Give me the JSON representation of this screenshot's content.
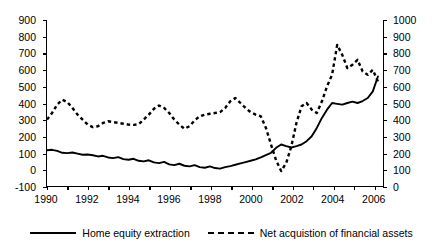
{
  "chart_data": {
    "type": "line",
    "title": "",
    "subtitle": "",
    "xlabel": "",
    "ylabel": "",
    "grid": false,
    "legend_position": "bottom",
    "x_tick_labels": [
      "1990",
      "1992",
      "1994",
      "1996",
      "1998",
      "2000",
      "2002",
      "2004",
      "2006"
    ],
    "x_tick_values": [
      1990,
      1992,
      1994,
      1996,
      1998,
      2000,
      2002,
      2004,
      2006
    ],
    "xlim": [
      1990,
      2006.5
    ],
    "axes": {
      "left": {
        "ylim": [
          -100,
          900
        ],
        "tick_labels": [
          "900",
          "800",
          "700",
          "600",
          "500",
          "400",
          "300",
          "200",
          "100",
          "0",
          "-100"
        ],
        "tick_values": [
          900,
          800,
          700,
          600,
          500,
          400,
          300,
          200,
          100,
          0,
          -100
        ]
      },
      "right": {
        "ylim": [
          0,
          1000
        ],
        "tick_labels": [
          "1000",
          "900",
          "800",
          "700",
          "600",
          "500",
          "400",
          "300",
          "200",
          "100",
          "0"
        ],
        "tick_values": [
          1000,
          900,
          800,
          700,
          600,
          500,
          400,
          300,
          200,
          100,
          0
        ]
      }
    },
    "series": [
      {
        "name": "Home equity extraction",
        "axis": "left",
        "style": "solid",
        "color": "#000000",
        "x": [
          1990.0,
          1990.25,
          1990.5,
          1990.75,
          1991.0,
          1991.25,
          1991.5,
          1991.75,
          1992.0,
          1992.25,
          1992.5,
          1992.75,
          1993.0,
          1993.25,
          1993.5,
          1993.75,
          1994.0,
          1994.25,
          1994.5,
          1994.75,
          1995.0,
          1995.25,
          1995.5,
          1995.75,
          1996.0,
          1996.25,
          1996.5,
          1996.75,
          1997.0,
          1997.25,
          1997.5,
          1997.75,
          1998.0,
          1998.25,
          1998.5,
          1998.75,
          1999.0,
          1999.25,
          1999.5,
          1999.75,
          2000.0,
          2000.25,
          2000.5,
          2000.75,
          2001.0,
          2001.25,
          2001.5,
          2001.75,
          2002.0,
          2002.25,
          2002.5,
          2002.75,
          2003.0,
          2003.25,
          2003.5,
          2003.75,
          2004.0,
          2004.25,
          2004.5,
          2004.75,
          2005.0,
          2005.25,
          2005.5,
          2005.75,
          2006.0,
          2006.25
        ],
        "values": [
          115,
          118,
          112,
          100,
          98,
          102,
          95,
          88,
          90,
          85,
          78,
          82,
          72,
          68,
          74,
          62,
          58,
          64,
          52,
          48,
          55,
          42,
          38,
          45,
          30,
          26,
          34,
          22,
          18,
          26,
          14,
          10,
          18,
          8,
          5,
          14,
          20,
          28,
          36,
          44,
          52,
          60,
          72,
          86,
          100,
          130,
          150,
          140,
          132,
          140,
          150,
          170,
          200,
          250,
          310,
          360,
          400,
          395,
          390,
          400,
          408,
          400,
          412,
          430,
          470,
          560
        ]
      },
      {
        "name": "Net acquistion of financial assets",
        "axis": "right",
        "style": "dashed",
        "color": "#000000",
        "x": [
          1990.0,
          1990.25,
          1990.5,
          1990.75,
          1991.0,
          1991.25,
          1991.5,
          1991.75,
          1992.0,
          1992.25,
          1992.5,
          1992.75,
          1993.0,
          1993.25,
          1993.5,
          1993.75,
          1994.0,
          1994.25,
          1994.5,
          1994.75,
          1995.0,
          1995.25,
          1995.5,
          1995.75,
          1996.0,
          1996.25,
          1996.5,
          1996.75,
          1997.0,
          1997.25,
          1997.5,
          1997.75,
          1998.0,
          1998.25,
          1998.5,
          1998.75,
          1999.0,
          1999.25,
          1999.5,
          1999.75,
          2000.0,
          2000.25,
          2000.5,
          2000.75,
          2001.0,
          2001.25,
          2001.5,
          2001.75,
          2002.0,
          2002.25,
          2002.5,
          2002.75,
          2003.0,
          2003.25,
          2003.5,
          2003.75,
          2004.0,
          2004.25,
          2004.5,
          2004.75,
          2005.0,
          2005.25,
          2005.5,
          2005.75,
          2006.0,
          2006.25
        ],
        "values": [
          400,
          440,
          490,
          520,
          505,
          470,
          430,
          400,
          370,
          355,
          360,
          380,
          390,
          385,
          380,
          375,
          370,
          368,
          372,
          400,
          430,
          465,
          485,
          470,
          440,
          400,
          370,
          345,
          360,
          395,
          420,
          430,
          435,
          440,
          445,
          470,
          510,
          530,
          500,
          470,
          445,
          430,
          420,
          350,
          250,
          155,
          90,
          140,
          240,
          380,
          480,
          500,
          460,
          440,
          510,
          600,
          670,
          850,
          790,
          710,
          730,
          760,
          690,
          670,
          700,
          630
        ]
      }
    ]
  },
  "legend": {
    "entries": [
      {
        "label": "Home equity extraction",
        "style": "solid"
      },
      {
        "label": "Net acquistion of financial assets",
        "style": "dashed"
      }
    ]
  }
}
